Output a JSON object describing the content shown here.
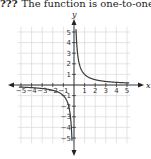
{
  "header": {
    "number": "???",
    "text": "The function is one-to-one."
  },
  "chart_data": {
    "type": "line",
    "title": "",
    "function": "y = 1/x",
    "xlabel": "x",
    "ylabel": "y",
    "xlim": [
      -5.3,
      5.3
    ],
    "ylim": [
      -5.5,
      5.5
    ],
    "grid": true,
    "x_ticks": [
      -5,
      -4,
      -3,
      -2,
      -1,
      1,
      2,
      3,
      4,
      5
    ],
    "y_ticks": [
      -5,
      -4,
      -3,
      -2,
      -1,
      1,
      2,
      3,
      4,
      5
    ],
    "series": [
      {
        "name": "right branch",
        "x": [
          0.2,
          0.25,
          0.33,
          0.5,
          0.75,
          1,
          1.5,
          2,
          3,
          4,
          5
        ],
        "y": [
          5,
          4,
          3,
          2,
          1.33,
          1,
          0.67,
          0.5,
          0.33,
          0.25,
          0.2
        ]
      },
      {
        "name": "left branch",
        "x": [
          -5,
          -4,
          -3,
          -2,
          -1.5,
          -1,
          -0.75,
          -0.5,
          -0.33,
          -0.25,
          -0.2
        ],
        "y": [
          -0.2,
          -0.25,
          -0.33,
          -0.5,
          -0.67,
          -1,
          -1.33,
          -2,
          -3,
          -4,
          -5
        ]
      }
    ],
    "colors": {
      "curve": "#3a3a3a",
      "axis": "#222222",
      "grid": "#d8d8d8"
    }
  }
}
